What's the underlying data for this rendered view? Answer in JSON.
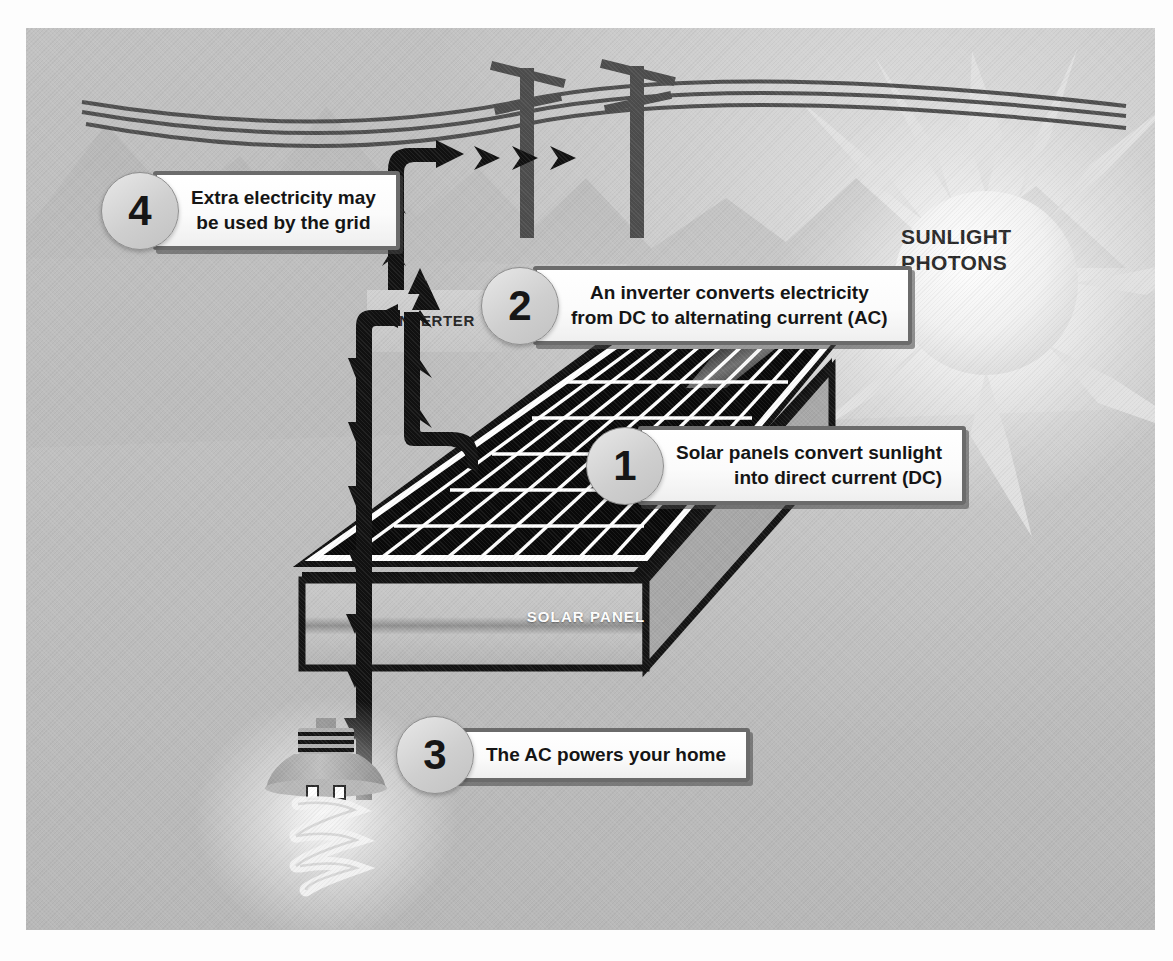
{
  "figure": {
    "background_color": "#bdbdbd",
    "frame_color": "#ffffff"
  },
  "labels": {
    "sun": "SUNLIGHT\nPHOTONS",
    "sun_line1": "SUNLIGHT",
    "sun_line2": "PHOTONS",
    "inverter": "INVERTER",
    "solar_panel": "SOLAR PANEL"
  },
  "callouts": [
    {
      "number": "1",
      "text": "Solar panels convert sunlight\ninto direct current (DC)",
      "align": "right"
    },
    {
      "number": "2",
      "text": "An inverter converts electricity\nfrom DC to alternating current (AC)",
      "align": "center"
    },
    {
      "number": "3",
      "text": "The AC powers your home",
      "align": "center"
    },
    {
      "number": "4",
      "text": "Extra electricity may\nbe used by the grid",
      "align": "center"
    }
  ],
  "scene_elements": {
    "sun": "sun-icon",
    "mountains": "mountain-range",
    "utility_poles": 2,
    "power_lines": 3,
    "light_bulb": "cfl-spiral-bulb",
    "solar_panel_grid": {
      "columns": 10,
      "rows": 6
    },
    "flow_arrows": [
      "panel-to-inverter-up",
      "inverter-to-home-down",
      "inverter-to-grid-up",
      "grid-horizontal-chevrons"
    ]
  },
  "colors": {
    "background": "#bdbdbd",
    "callout_border": "#6b6b6b",
    "callout_fill": "#ffffff",
    "badge_fill": "#d8d8d8",
    "arrow": "#111111",
    "panel_cells": "#0b0b0b",
    "panel_gridlines": "#ffffff",
    "pole": "#4d4d4d",
    "sun_glow": "#ffffff"
  }
}
